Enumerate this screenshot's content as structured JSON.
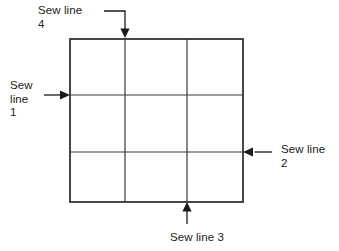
{
  "figure": {
    "background_color": "#ffffff",
    "line_color": "#333333",
    "text_color": "#1a1a1a"
  },
  "grid": {
    "description": "3 by 3 square grid of patches",
    "rows": 3,
    "columns": 3,
    "outer_left": 70,
    "outer_top": 39,
    "outer_right": 243,
    "outer_bottom": 202,
    "vertical_line_x": [
      125,
      187
    ],
    "horizontal_line_y": [
      95,
      152
    ],
    "outer_stroke_width": 1.8,
    "inner_stroke_width": 1.2
  },
  "labels": {
    "sew_line_4": "Sew line\n4",
    "sew_line_1": "Sew\nline\n1",
    "sew_line_2": "Sew line\n2",
    "sew_line_3": "Sew line 3"
  },
  "annotations": [
    {
      "name": "sew-line-4",
      "text": "Sew line 4",
      "arrow_direction": "down",
      "arrow_style": "elbow",
      "points_to_edge": "top",
      "target_x": 125,
      "target_y": 39
    },
    {
      "name": "sew-line-1",
      "text": "Sew line 1",
      "arrow_direction": "right",
      "arrow_style": "straight",
      "points_to_edge": "left",
      "target_x": 70,
      "target_y": 95
    },
    {
      "name": "sew-line-2",
      "text": "Sew line 2",
      "arrow_direction": "left",
      "arrow_style": "straight",
      "points_to_edge": "right",
      "target_x": 243,
      "target_y": 152
    },
    {
      "name": "sew-line-3",
      "text": "Sew line 3",
      "arrow_direction": "up",
      "arrow_style": "straight",
      "points_to_edge": "bottom",
      "target_x": 187,
      "target_y": 202
    }
  ]
}
